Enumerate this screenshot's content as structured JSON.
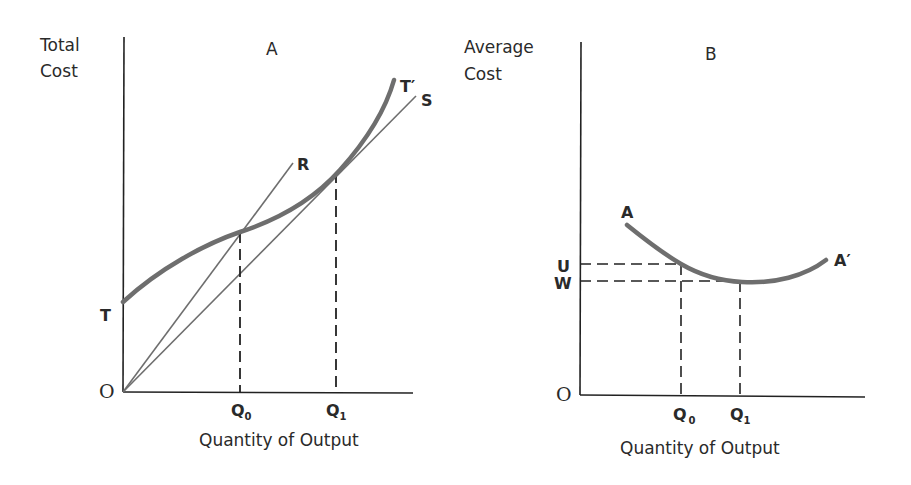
{
  "panels": {
    "a": {
      "title": "A",
      "y_axis_label_line1": "Total",
      "y_axis_label_line2": "Cost",
      "x_axis_label": "Quantity of Output",
      "origin_label": "O",
      "curve_start_label": "T",
      "curve_end_label": "T′",
      "ray_labels": {
        "r": "R",
        "s": "S"
      },
      "q0": {
        "main": "Q",
        "sub": "0"
      },
      "q1": {
        "main": "Q",
        "sub": "1"
      }
    },
    "b": {
      "title": "B",
      "y_axis_label_line1": "Average",
      "y_axis_label_line2": "Cost",
      "x_axis_label": "Quantity of Output",
      "origin_label": "O",
      "curve_start_label": "A",
      "curve_end_label": "A′",
      "u_label": "U",
      "w_label": "W",
      "q0": {
        "main": "Q",
        "sub": "0"
      },
      "q1": {
        "main": "Q",
        "sub": "1"
      }
    }
  },
  "colors": {
    "axis": "#222222",
    "curve": "#6e6e6e",
    "ray": "#6e6e6e",
    "dashed": "#222222",
    "text": "#2a2a2a"
  }
}
